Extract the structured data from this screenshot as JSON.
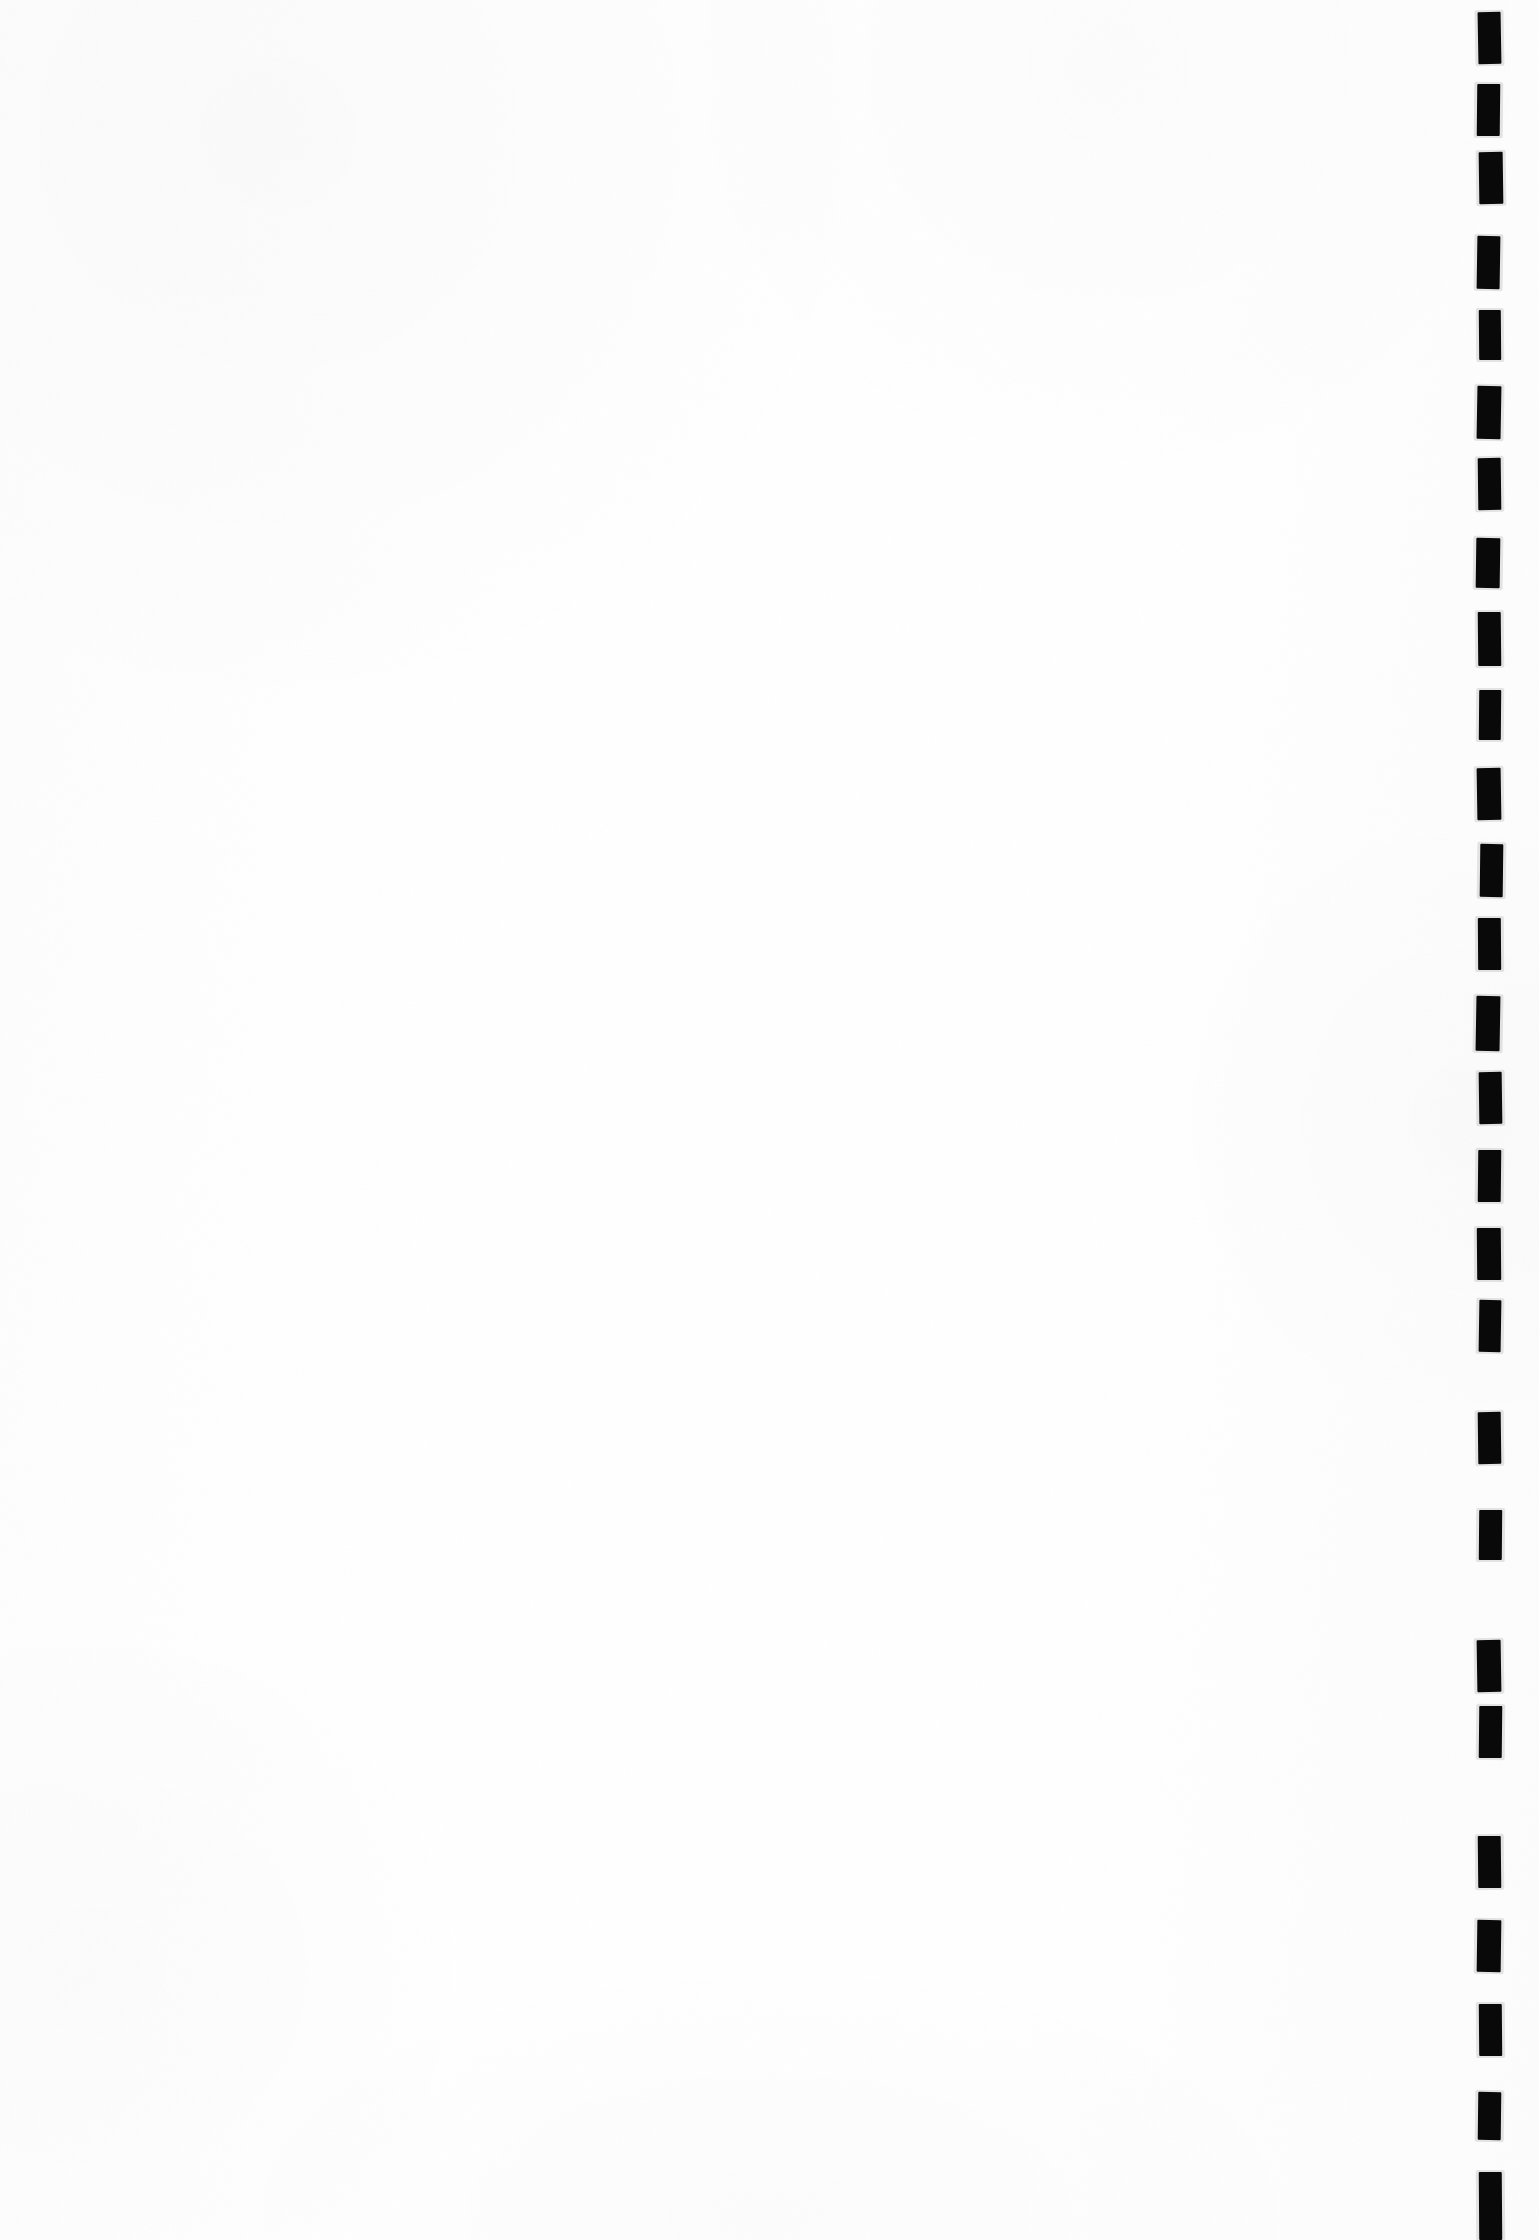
{
  "document": {
    "kind": "scanned-blank-page",
    "page_width": 1539,
    "page_height": 2240,
    "page_background_color": "#fefefe",
    "body_text": "",
    "caption": "",
    "page_number": ""
  },
  "content_area": {
    "label": "blank page body",
    "text": ""
  },
  "marks": {
    "label": "edge registration marks",
    "count": 22,
    "color": "#0a0a0a",
    "icon": "solid-rectangle-mark",
    "items": [
      {
        "x": 1478,
        "y": 12,
        "w": 23,
        "h": 52,
        "rotate": -1.0
      },
      {
        "x": 1477,
        "y": 84,
        "w": 23,
        "h": 52,
        "rotate": 0.6
      },
      {
        "x": 1479,
        "y": 152,
        "w": 24,
        "h": 52,
        "rotate": -0.8
      },
      {
        "x": 1477,
        "y": 236,
        "w": 23,
        "h": 53,
        "rotate": 0.9
      },
      {
        "x": 1479,
        "y": 310,
        "w": 22,
        "h": 50,
        "rotate": -0.5
      },
      {
        "x": 1477,
        "y": 386,
        "w": 24,
        "h": 53,
        "rotate": 1.0
      },
      {
        "x": 1478,
        "y": 458,
        "w": 23,
        "h": 52,
        "rotate": -0.7
      },
      {
        "x": 1476,
        "y": 538,
        "w": 24,
        "h": 50,
        "rotate": 0.8
      },
      {
        "x": 1478,
        "y": 612,
        "w": 23,
        "h": 54,
        "rotate": -0.6
      },
      {
        "x": 1479,
        "y": 690,
        "w": 22,
        "h": 50,
        "rotate": 0.5
      },
      {
        "x": 1477,
        "y": 768,
        "w": 24,
        "h": 52,
        "rotate": -0.9
      },
      {
        "x": 1480,
        "y": 844,
        "w": 23,
        "h": 53,
        "rotate": 0.7
      },
      {
        "x": 1478,
        "y": 918,
        "w": 23,
        "h": 52,
        "rotate": -0.4
      },
      {
        "x": 1476,
        "y": 996,
        "w": 24,
        "h": 55,
        "rotate": 1.0
      },
      {
        "x": 1479,
        "y": 1072,
        "w": 23,
        "h": 52,
        "rotate": -0.8
      },
      {
        "x": 1478,
        "y": 1150,
        "w": 23,
        "h": 52,
        "rotate": 0.6
      },
      {
        "x": 1477,
        "y": 1228,
        "w": 24,
        "h": 52,
        "rotate": -0.5
      },
      {
        "x": 1479,
        "y": 1300,
        "w": 22,
        "h": 52,
        "rotate": 0.9
      },
      {
        "x": 1478,
        "y": 1412,
        "w": 23,
        "h": 52,
        "rotate": -0.7
      },
      {
        "x": 1479,
        "y": 1510,
        "w": 23,
        "h": 50,
        "rotate": 0.5
      },
      {
        "x": 1477,
        "y": 1640,
        "w": 24,
        "h": 52,
        "rotate": -0.9
      },
      {
        "x": 1479,
        "y": 1706,
        "w": 23,
        "h": 52,
        "rotate": 0.6
      },
      {
        "x": 1478,
        "y": 1836,
        "w": 23,
        "h": 52,
        "rotate": -0.6
      },
      {
        "x": 1477,
        "y": 1920,
        "w": 24,
        "h": 52,
        "rotate": 0.8
      },
      {
        "x": 1479,
        "y": 2004,
        "w": 23,
        "h": 52,
        "rotate": -0.5
      },
      {
        "x": 1478,
        "y": 2092,
        "w": 23,
        "h": 48,
        "rotate": 0.7
      },
      {
        "x": 1479,
        "y": 2172,
        "w": 23,
        "h": 68,
        "rotate": -0.4
      }
    ]
  }
}
